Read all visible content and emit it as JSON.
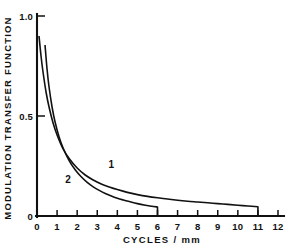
{
  "chart_data": {
    "type": "line",
    "title": "",
    "xlabel": "CYCLES / mm",
    "ylabel": "MODULATION TRANSFER FUNCTION",
    "xlim": [
      0,
      12
    ],
    "ylim": [
      0,
      1.0
    ],
    "grid": false,
    "legend_position": "inline-curve-labels",
    "xticks": [
      0,
      1,
      2,
      3,
      4,
      5,
      6,
      7,
      8,
      9,
      10,
      11,
      12
    ],
    "xtick_labels": [
      "0",
      "1",
      "2",
      "3",
      "4",
      "5",
      "6",
      "7",
      "8",
      "9",
      "10",
      "11",
      "12"
    ],
    "yticks": [
      0,
      0.5,
      1.0
    ],
    "ytick_labels": [
      "0",
      "0.5",
      "1.0"
    ],
    "series": [
      {
        "name": "1",
        "label": "1",
        "label_x": 3.7,
        "label_y": 0.24,
        "color": "#111111",
        "x": [
          0.1,
          0.2,
          0.3,
          0.45,
          0.6,
          0.8,
          1.0,
          1.3,
          1.6,
          2.0,
          2.4,
          2.8,
          3.2,
          3.6,
          4.0,
          4.5,
          5.0,
          5.5,
          6.0,
          6.5,
          7.0,
          7.5,
          8.0,
          8.5,
          9.0,
          9.5,
          10.0,
          10.5,
          11.0
        ],
        "y": [
          0.9,
          0.8,
          0.72,
          0.62,
          0.545,
          0.465,
          0.405,
          0.335,
          0.288,
          0.24,
          0.205,
          0.18,
          0.16,
          0.145,
          0.132,
          0.118,
          0.107,
          0.098,
          0.091,
          0.085,
          0.079,
          0.074,
          0.07,
          0.066,
          0.062,
          0.058,
          0.054,
          0.05,
          0.046
        ],
        "terminates_with_drop_to_axis": true,
        "end_x": 11.0
      },
      {
        "name": "2",
        "label": "2",
        "label_x": 1.55,
        "label_y": 0.165,
        "color": "#111111",
        "x": [
          0.4,
          0.5,
          0.6,
          0.75,
          0.9,
          1.1,
          1.3,
          1.6,
          1.9,
          2.2,
          2.5,
          2.8,
          3.1,
          3.4,
          3.7,
          4.0,
          4.3,
          4.6,
          5.0,
          5.4,
          5.7,
          6.0
        ],
        "y": [
          0.855,
          0.735,
          0.645,
          0.545,
          0.47,
          0.395,
          0.34,
          0.277,
          0.231,
          0.196,
          0.168,
          0.146,
          0.128,
          0.113,
          0.1,
          0.089,
          0.08,
          0.072,
          0.062,
          0.054,
          0.049,
          0.045
        ],
        "terminates_with_drop_to_axis": true,
        "end_x": 6.0
      }
    ]
  },
  "axes": {
    "x_title": "CYCLES / mm",
    "y_title": "MODULATION TRANSFER FUNCTION"
  }
}
